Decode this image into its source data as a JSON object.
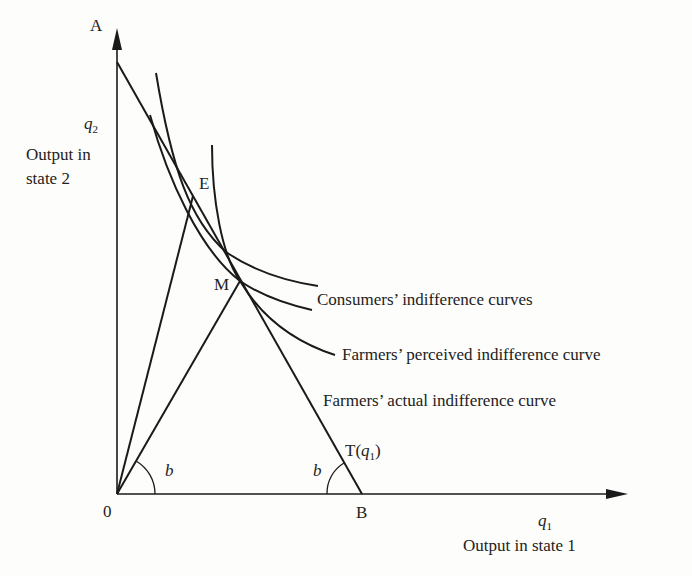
{
  "diagram": {
    "axes": {
      "y_symbol": "q",
      "y_subscript": "2",
      "y_label_line1": "Output in",
      "y_label_line2": "state 2",
      "x_symbol": "q",
      "x_subscript": "1",
      "x_label": "Output in state 1",
      "origin": "0"
    },
    "points": {
      "A": "A",
      "B": "B",
      "E": "E",
      "M": "M"
    },
    "angle_labels": [
      "b",
      "b"
    ],
    "transformation_curve": {
      "prefix": "T(",
      "symbol": "q",
      "subscript": "1",
      "suffix": ")"
    },
    "curve_labels": {
      "consumers": "Consumers’ indifference curves",
      "farmers_perceived": "Farmers’ perceived indifference curve",
      "farmers_actual": "Farmers’ actual indifference curve"
    },
    "colors": {
      "ink": "#1a1a1a",
      "background": "#fdfdfb"
    }
  }
}
